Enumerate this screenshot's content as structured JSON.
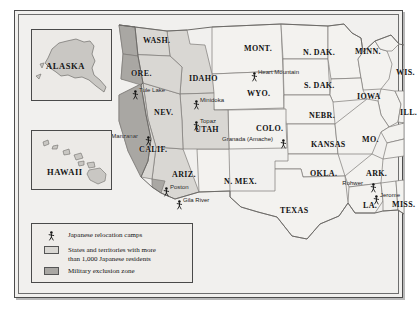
{
  "insets": [
    {
      "id": "alaska",
      "label": "ALASKA"
    },
    {
      "id": "hawaii",
      "label": "HAWAII"
    }
  ],
  "states": [
    {
      "label": "WASH.",
      "x": 128,
      "y": 25
    },
    {
      "label": "ORE.",
      "x": 116,
      "y": 58
    },
    {
      "label": "IDAHO",
      "x": 174,
      "y": 63
    },
    {
      "label": "MONT.",
      "x": 229,
      "y": 33
    },
    {
      "label": "N. DAK.",
      "x": 288,
      "y": 37
    },
    {
      "label": "MINN.",
      "x": 340,
      "y": 36
    },
    {
      "label": "WIS.",
      "x": 381,
      "y": 57
    },
    {
      "label": "S. DAK.",
      "x": 289,
      "y": 70
    },
    {
      "label": "WYO.",
      "x": 232,
      "y": 78
    },
    {
      "label": "NEV.",
      "x": 139,
      "y": 97
    },
    {
      "label": "UTAH",
      "x": 180,
      "y": 114
    },
    {
      "label": "COLO.",
      "x": 241,
      "y": 113
    },
    {
      "label": "NEBR.",
      "x": 294,
      "y": 100
    },
    {
      "label": "IOWA",
      "x": 342,
      "y": 81
    },
    {
      "label": "ILL.",
      "x": 385,
      "y": 97
    },
    {
      "label": "KANSAS",
      "x": 296,
      "y": 129
    },
    {
      "label": "MO.",
      "x": 347,
      "y": 124
    },
    {
      "label": "CALIF.",
      "x": 124,
      "y": 134
    },
    {
      "label": "ARIZ.",
      "x": 157,
      "y": 159
    },
    {
      "label": "N. MEX.",
      "x": 209,
      "y": 166
    },
    {
      "label": "OKLA.",
      "x": 295,
      "y": 158
    },
    {
      "label": "ARK.",
      "x": 351,
      "y": 158
    },
    {
      "label": "TEXAS",
      "x": 265,
      "y": 195
    },
    {
      "label": "LA.",
      "x": 348,
      "y": 190
    },
    {
      "label": "MISS.",
      "x": 377,
      "y": 189
    }
  ],
  "camps": [
    {
      "name": "Tule Lake",
      "x": 117,
      "y": 75,
      "side": "right"
    },
    {
      "name": "Minidoka",
      "x": 178,
      "y": 85,
      "side": "right"
    },
    {
      "name": "Heart Mountain",
      "x": 236,
      "y": 57,
      "side": "right"
    },
    {
      "name": "Topaz",
      "x": 178,
      "y": 106,
      "side": "right"
    },
    {
      "name": "Manzanar",
      "x": 130,
      "y": 121,
      "side": "left"
    },
    {
      "name": "Granada\n(Amache)",
      "x": 265,
      "y": 124,
      "side": "left"
    },
    {
      "name": "Poston",
      "x": 148,
      "y": 172,
      "side": "right"
    },
    {
      "name": "Gila River",
      "x": 161,
      "y": 185,
      "side": "right"
    },
    {
      "name": "Rohwer",
      "x": 355,
      "y": 168,
      "side": "left"
    },
    {
      "name": "Jerome",
      "x": 358,
      "y": 180,
      "side": "right"
    }
  ],
  "legend": {
    "camps_label": "Japanese relocation camps",
    "states_label": "States and territories with more\nthan 1,000 Japanese residents",
    "zone_label": "Military exclusion zone",
    "camp_marker_icon": "relocation-camp-marker-icon",
    "states_swatch_color": "#d9d7d3",
    "zone_swatch_color": "#a9a7a3"
  },
  "colors": {
    "page_background": "#ffffff",
    "map_background": "#f1f0ee",
    "state_fill_plain": "#f3f2ef",
    "state_fill_japanese_residents": "#d9d7d3",
    "military_exclusion_zone": "#a9a7a3",
    "border_line": "#7c7a77",
    "frame_line": "#4c4c4c",
    "text": "#121212"
  }
}
